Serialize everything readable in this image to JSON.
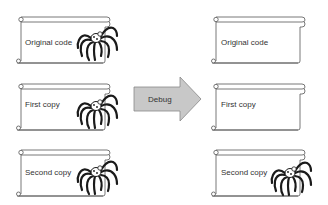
{
  "diagram": {
    "left_column": [
      {
        "label": "Original code",
        "has_bug": true
      },
      {
        "label": "First copy",
        "has_bug": true
      },
      {
        "label": "Second copy",
        "has_bug": true
      }
    ],
    "arrow": {
      "label": "Debug",
      "fill": "#c8c8c8",
      "stroke": "#888888"
    },
    "right_column": [
      {
        "label": "Original code",
        "has_bug": false
      },
      {
        "label": "First copy",
        "has_bug": false
      },
      {
        "label": "Second copy",
        "has_bug": true
      }
    ],
    "colors": {
      "scroll_stroke": "#555555",
      "spider": "#1a1a1a",
      "text": "#333333"
    }
  }
}
